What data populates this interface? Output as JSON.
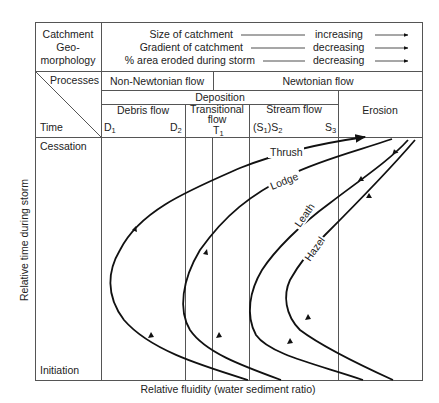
{
  "header": {
    "left_label_lines": [
      "Catchment",
      "Geo-",
      "morphology"
    ],
    "trends": [
      {
        "label": "Size of catchment",
        "direction": "increasing"
      },
      {
        "label": "Gradient of catchment",
        "direction": "decreasing"
      },
      {
        "label": "% area eroded during storm",
        "direction": "decreasing"
      }
    ]
  },
  "corner": {
    "top": "Processes",
    "bottom": "Time"
  },
  "processes": {
    "non_newtonian": "Non-Newtonian flow",
    "newtonian": "Newtonian flow"
  },
  "deposition": "Deposition",
  "erosion": "Erosion",
  "columns": {
    "debris": {
      "label": "Debris flow",
      "d1": "D",
      "d1_sub": "1",
      "d2": "D",
      "d2_sub": "2"
    },
    "transitional": {
      "line1": "Transitional",
      "line2": "flow",
      "t1": "T",
      "t1_sub": "1"
    },
    "stream": {
      "label": "Stream flow",
      "s12": "(S",
      "s12_sub1": "1",
      "s12_mid": ")S",
      "s12_sub2": "2",
      "s3": "S",
      "s3_sub": "3"
    }
  },
  "time_rows": {
    "top": "Cessation",
    "bottom": "Initiation"
  },
  "axes": {
    "y_label": "Relative time during storm",
    "x_label": "Relative fluidity (water sediment ratio)"
  },
  "curves": [
    {
      "name": "Thrush"
    },
    {
      "name": "Lodge"
    },
    {
      "name": "Leath"
    },
    {
      "name": "Hazel"
    }
  ],
  "colors": {
    "line": "#111111",
    "grid": "#555555",
    "text": "#222222"
  }
}
